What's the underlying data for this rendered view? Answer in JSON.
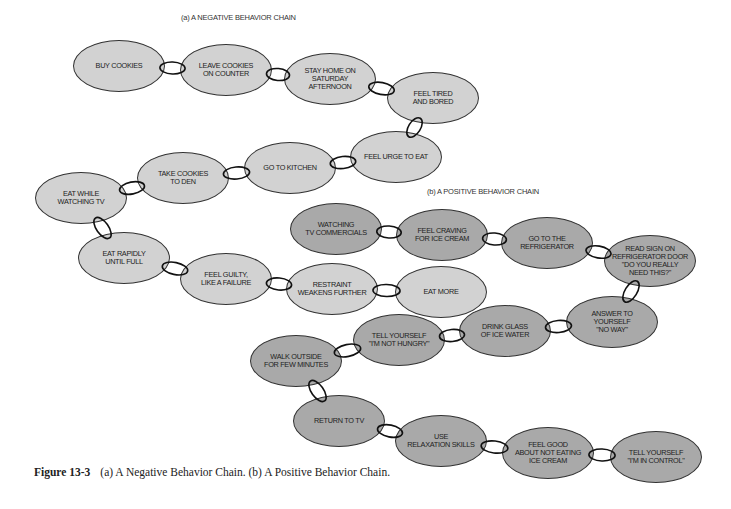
{
  "titles": {
    "negative": "(a) A NEGATIVE BEHAVIOR CHAIN",
    "positive": "(b) A POSITIVE BEHAVIOR CHAIN"
  },
  "colors": {
    "negative_fill": "#d2d2d2",
    "positive_fill": "#a9a9a9",
    "outline": "#333333"
  },
  "negative_chain": [
    {
      "label": "BUY COOKIES",
      "cx": 119,
      "cy": 66
    },
    {
      "label": "LEAVE COOKIES\nON COUNTER",
      "cx": 226,
      "cy": 70
    },
    {
      "label": "STAY HOME ON\nSATURDAY\nAFTERNOON",
      "cx": 330,
      "cy": 79
    },
    {
      "label": "FEEL TIRED\nAND BORED",
      "cx": 433,
      "cy": 98
    },
    {
      "label": "FEEL URGE TO EAT",
      "cx": 396,
      "cy": 157
    },
    {
      "label": "GO TO KITCHEN",
      "cx": 290,
      "cy": 168
    },
    {
      "label": "TAKE COOKIES\nTO DEN",
      "cx": 183,
      "cy": 178
    },
    {
      "label": "EAT WHILE\nWATCHING TV",
      "cx": 81,
      "cy": 198
    },
    {
      "label": "EAT RAPIDLY\nUNTIL FULL",
      "cx": 124,
      "cy": 258
    },
    {
      "label": "FEEL GUILTY,\nLIKE A FAILURE",
      "cx": 226,
      "cy": 279
    },
    {
      "label": "RESTRAINT\nWEAKENS FURTHER",
      "cx": 332,
      "cy": 289
    },
    {
      "label": "EAT MORE",
      "cx": 441,
      "cy": 292
    }
  ],
  "positive_chain": [
    {
      "label": "WATCHING\nTV COMMERCIALS",
      "cx": 336,
      "cy": 229
    },
    {
      "label": "FEEL CRAVING\nFOR ICE CREAM",
      "cx": 442,
      "cy": 235
    },
    {
      "label": "GO TO THE\nREFRIGERATOR",
      "cx": 547,
      "cy": 243
    },
    {
      "label": "READ SIGN ON\nREFRIGERATOR DOOR\n\"DO YOU REALLY\nNEED THIS?\"",
      "cx": 650,
      "cy": 261
    },
    {
      "label": "ANSWER TO\nYOURSELF\n\"NO WAY\"",
      "cx": 612,
      "cy": 322
    },
    {
      "label": "DRINK GLASS\nOF ICE WATER",
      "cx": 505,
      "cy": 331
    },
    {
      "label": "TELL YOURSELF\n\"I'M NOT HUNGRY\"",
      "cx": 399,
      "cy": 340
    },
    {
      "label": "WALK OUTSIDE\nFOR FEW MINUTES",
      "cx": 296,
      "cy": 361
    },
    {
      "label": "RETURN TO TV",
      "cx": 339,
      "cy": 421
    },
    {
      "label": "USE\nRELAXATION SKILLS",
      "cx": 441,
      "cy": 441
    },
    {
      "label": "FEEL GOOD\nABOUT NOT EATING\nICE CREAM",
      "cx": 548,
      "cy": 453
    },
    {
      "label": "TELL YOURSELF\n\"I'M IN CONTROL\"",
      "cx": 656,
      "cy": 457
    }
  ],
  "caption": {
    "figure_label": "Figure 13-3",
    "text": "(a) A Negative Behavior Chain. (b) A Positive Behavior Chain."
  }
}
